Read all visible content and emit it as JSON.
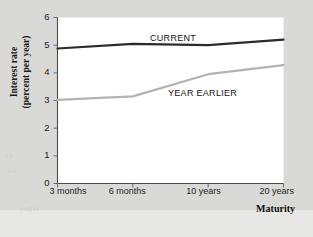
{
  "figure": {
    "background_color": "#d9d9d7",
    "plot_background_color": "#ffffff",
    "footer_band_color": "#e7e7e5"
  },
  "axes": {
    "y_title_line1": "Interest rate",
    "y_title_line2": "(percent per year)",
    "x_title": "Maturity",
    "y_ticks": [
      "0",
      "1",
      "2",
      "3",
      "4",
      "5",
      "6"
    ],
    "x_ticks": [
      "3 months",
      "6 months",
      "10 years",
      "20 years"
    ]
  },
  "series_labels": {
    "current": "CURRENT",
    "year_earlier": "YEAR EARLIER"
  },
  "artifacts": {
    "a": "( )",
    "b": "o r.",
    "c": "(vd) bi"
  },
  "chart_data": {
    "type": "line",
    "title": "",
    "subtitle": "",
    "xlabel": "Maturity",
    "ylabel": "Interest rate (percent per year)",
    "categories": [
      "3 months",
      "6 months",
      "10 years",
      "20 years"
    ],
    "x_tick_positions": [
      0,
      1,
      2,
      3
    ],
    "ylim": [
      0,
      6
    ],
    "y_tick_values": [
      0,
      1,
      2,
      3,
      4,
      5,
      6
    ],
    "grid": false,
    "legend": "inline-labels",
    "series": [
      {
        "name": "CURRENT",
        "color": "#2b2b2b",
        "line_width": 2.2,
        "values": [
          4.88,
          5.05,
          5.0,
          5.2
        ],
        "points": [
          {
            "x": "3 months",
            "y": 4.88
          },
          {
            "x": "6 months",
            "y": 5.05
          },
          {
            "x": "10 years",
            "y": 5.0
          },
          {
            "x": "20 years",
            "y": 5.2
          }
        ]
      },
      {
        "name": "YEAR EARLIER",
        "color": "#b3b3b3",
        "line_width": 2.2,
        "values": [
          3.02,
          3.15,
          3.95,
          4.28
        ],
        "points": [
          {
            "x": "3 months",
            "y": 3.02
          },
          {
            "x": "6 months",
            "y": 3.15
          },
          {
            "x": "10 years",
            "y": 3.95
          },
          {
            "x": "20 years",
            "y": 4.28
          }
        ]
      }
    ]
  }
}
